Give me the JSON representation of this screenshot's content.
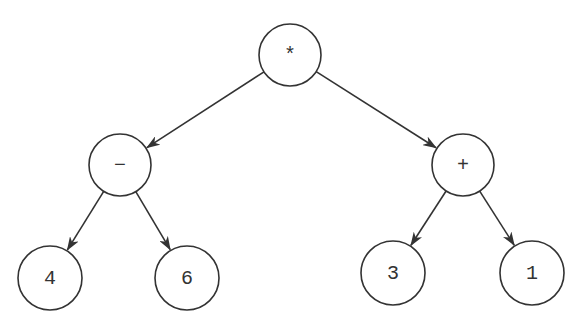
{
  "diagram": {
    "type": "expression-tree",
    "stroke_color": "#333333",
    "background": "#ffffff",
    "nodes": [
      {
        "id": "root",
        "label": "*",
        "cx": 290,
        "cy": 55,
        "r": 31
      },
      {
        "id": "minus",
        "label": "−",
        "cx": 120,
        "cy": 165,
        "r": 31
      },
      {
        "id": "plus",
        "label": "+",
        "cx": 463,
        "cy": 165,
        "r": 31
      },
      {
        "id": "four",
        "label": "4",
        "cx": 50,
        "cy": 278,
        "r": 32
      },
      {
        "id": "six",
        "label": "6",
        "cx": 187,
        "cy": 278,
        "r": 32
      },
      {
        "id": "three",
        "label": "3",
        "cx": 393,
        "cy": 273,
        "r": 32
      },
      {
        "id": "one",
        "label": "1",
        "cx": 532,
        "cy": 273,
        "r": 32
      }
    ],
    "edges": [
      {
        "from": "root",
        "to": "minus"
      },
      {
        "from": "root",
        "to": "plus"
      },
      {
        "from": "minus",
        "to": "four"
      },
      {
        "from": "minus",
        "to": "six"
      },
      {
        "from": "plus",
        "to": "three"
      },
      {
        "from": "plus",
        "to": "one"
      }
    ]
  }
}
